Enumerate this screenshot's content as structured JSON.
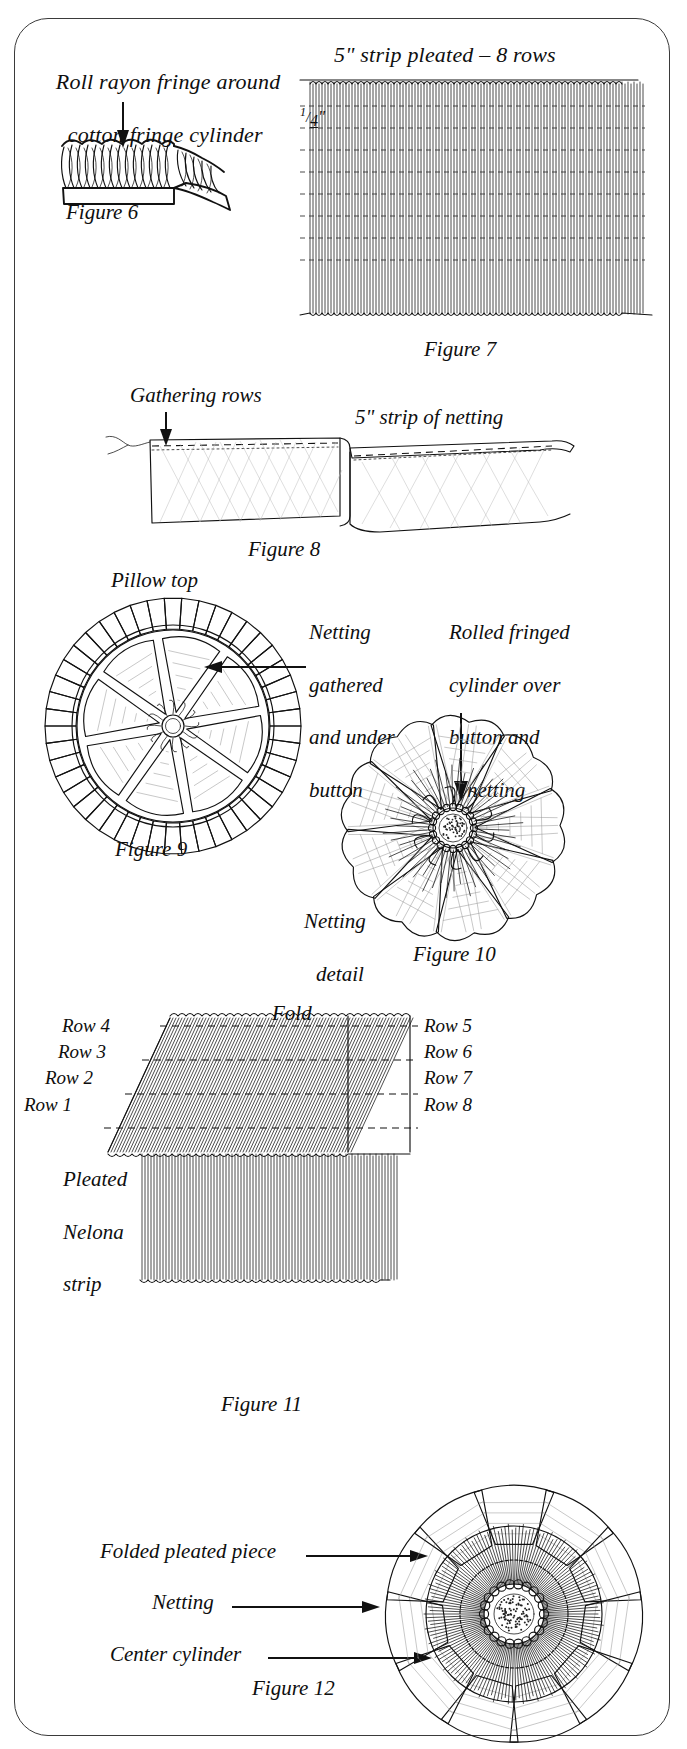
{
  "page": {
    "border_color": "#3a3a3a",
    "background_color": "#ffffff",
    "ink_color": "#111111"
  },
  "figures": [
    {
      "id": "figure-6",
      "label": "Figure 6",
      "caption_line1": "Roll rayon fringe around",
      "caption_line2": "cotton fringe cylinder",
      "description": "Fringe strip with loops being rolled into a cylinder, arrow pointing down onto the fringe"
    },
    {
      "id": "figure-7",
      "label": "Figure 7",
      "caption": "5\" strip pleated – 8 rows",
      "measure": "1/4\"",
      "measure_numerator": "1",
      "measure_denominator": "4",
      "measure_unit": "\"",
      "row_count": 8,
      "description": "Vertically pleated 5 inch strip with eight horizontal dashed gathering rows"
    },
    {
      "id": "figure-8",
      "label": "Figure 8",
      "annotation_left": "Gathering rows",
      "annotation_right": "5\" strip of netting",
      "description": "Folded strip of netting with gathering rows stitched along the top edge"
    },
    {
      "id": "figure-9",
      "label": "Figure 9",
      "annotation_top": "Pillow top",
      "annotation_right_line1": "Netting",
      "annotation_right_line2": "gathered",
      "annotation_right_line3": "and under",
      "annotation_right_line4": "button",
      "description": "Circular pillow top with pleated outer ruffle and gathered netting petals radiating from a center button"
    },
    {
      "id": "figure-10",
      "label": "Figure 10",
      "annotation_line1": "Rolled fringed",
      "annotation_line2": "cylinder over",
      "annotation_line3": "button and",
      "annotation_line4": "netting",
      "annotation_detail_line1": "Netting",
      "annotation_detail_line2": "detail",
      "description": "Flower-like assembly of netting petals with rolled fringed cylinder at center"
    },
    {
      "id": "figure-11",
      "label": "Figure 11",
      "annotation_fold": "Fold",
      "annotation_strip_line1": "Pleated",
      "annotation_strip_line2": "Nelona",
      "annotation_strip_line3": "strip",
      "rows_left": [
        "Row 4",
        "Row 3",
        "Row 2",
        "Row 1"
      ],
      "rows_right": [
        "Row 5",
        "Row 6",
        "Row 7",
        "Row 8"
      ],
      "description": "Pleated Nelona strip folded over, with rows 1-4 on the left side and rows 5-8 on the right side"
    },
    {
      "id": "figure-12",
      "label": "Figure 12",
      "callouts": [
        "Folded pleated piece",
        "Netting",
        "Center cylinder"
      ],
      "description": "Finished rosette viewed from above with callout arrows to the folded pleated piece, the netting and the center cylinder"
    }
  ]
}
